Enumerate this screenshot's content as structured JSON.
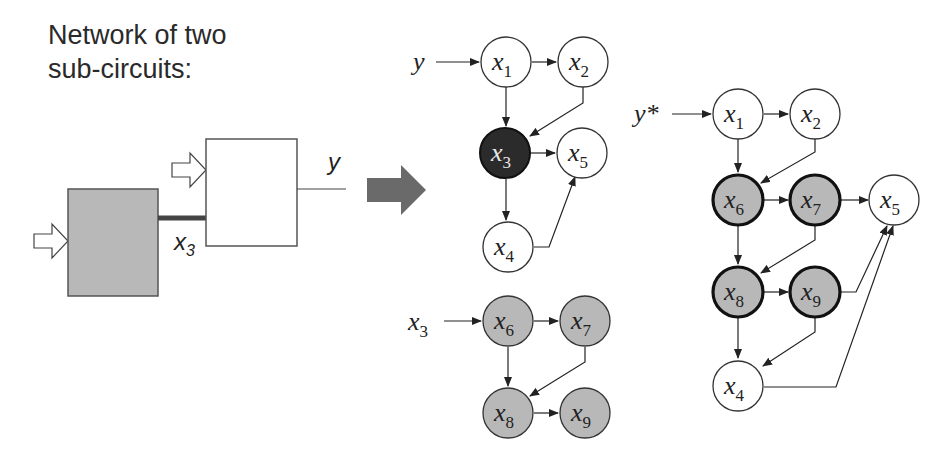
{
  "title": {
    "line1": "Network of two",
    "line2": "sub-circuits:"
  },
  "circuit": {
    "output_label": "y",
    "wire_label_main": "x",
    "wire_label_sub": "3",
    "colors": {
      "subcircuit_fill": "#b8b8b8",
      "box_border": "#555555",
      "wire": "#444444",
      "big_arrow": "#6a6a6a"
    }
  },
  "graph_top": {
    "input_label": "y",
    "nodes": [
      {
        "id": "x1",
        "main": "x",
        "sub": "1",
        "fill": "#ffffff"
      },
      {
        "id": "x2",
        "main": "x",
        "sub": "2",
        "fill": "#ffffff"
      },
      {
        "id": "x3",
        "main": "x",
        "sub": "3",
        "fill": "#2b2b2b"
      },
      {
        "id": "x5",
        "main": "x",
        "sub": "5",
        "fill": "#ffffff"
      },
      {
        "id": "x4",
        "main": "x",
        "sub": "4",
        "fill": "#ffffff"
      }
    ],
    "edges": [
      [
        "y",
        "x1"
      ],
      [
        "x1",
        "x2"
      ],
      [
        "x1",
        "x3"
      ],
      [
        "x2",
        "x3"
      ],
      [
        "x3",
        "x5"
      ],
      [
        "x3",
        "x4"
      ],
      [
        "x4",
        "x5"
      ]
    ]
  },
  "graph_bottom": {
    "input_label": "x",
    "input_sub": "3",
    "nodes": [
      {
        "id": "x6",
        "main": "x",
        "sub": "6",
        "fill": "#b8b8b8"
      },
      {
        "id": "x7",
        "main": "x",
        "sub": "7",
        "fill": "#b8b8b8"
      },
      {
        "id": "x8",
        "main": "x",
        "sub": "8",
        "fill": "#b8b8b8"
      },
      {
        "id": "x9",
        "main": "x",
        "sub": "9",
        "fill": "#b8b8b8"
      }
    ],
    "edges": [
      [
        "x3",
        "x6"
      ],
      [
        "x6",
        "x7"
      ],
      [
        "x6",
        "x8"
      ],
      [
        "x7",
        "x8"
      ],
      [
        "x8",
        "x9"
      ]
    ]
  },
  "graph_right": {
    "input_label": "y*",
    "nodes": [
      {
        "id": "x1",
        "main": "x",
        "sub": "1",
        "fill": "#ffffff"
      },
      {
        "id": "x2",
        "main": "x",
        "sub": "2",
        "fill": "#ffffff"
      },
      {
        "id": "x6",
        "main": "x",
        "sub": "6",
        "fill": "#b8b8b8"
      },
      {
        "id": "x7",
        "main": "x",
        "sub": "7",
        "fill": "#b8b8b8"
      },
      {
        "id": "x5",
        "main": "x",
        "sub": "5",
        "fill": "#ffffff"
      },
      {
        "id": "x8",
        "main": "x",
        "sub": "8",
        "fill": "#b8b8b8"
      },
      {
        "id": "x9",
        "main": "x",
        "sub": "9",
        "fill": "#b8b8b8"
      },
      {
        "id": "x4",
        "main": "x",
        "sub": "4",
        "fill": "#ffffff"
      }
    ],
    "edges": [
      [
        "y*",
        "x1"
      ],
      [
        "x1",
        "x2"
      ],
      [
        "x1",
        "x6"
      ],
      [
        "x2",
        "x6"
      ],
      [
        "x6",
        "x7"
      ],
      [
        "x7",
        "x5"
      ],
      [
        "x6",
        "x8"
      ],
      [
        "x7",
        "x8"
      ],
      [
        "x8",
        "x9"
      ],
      [
        "x9",
        "x5"
      ],
      [
        "x8",
        "x4"
      ],
      [
        "x9",
        "x4"
      ],
      [
        "x4",
        "x5"
      ]
    ]
  }
}
